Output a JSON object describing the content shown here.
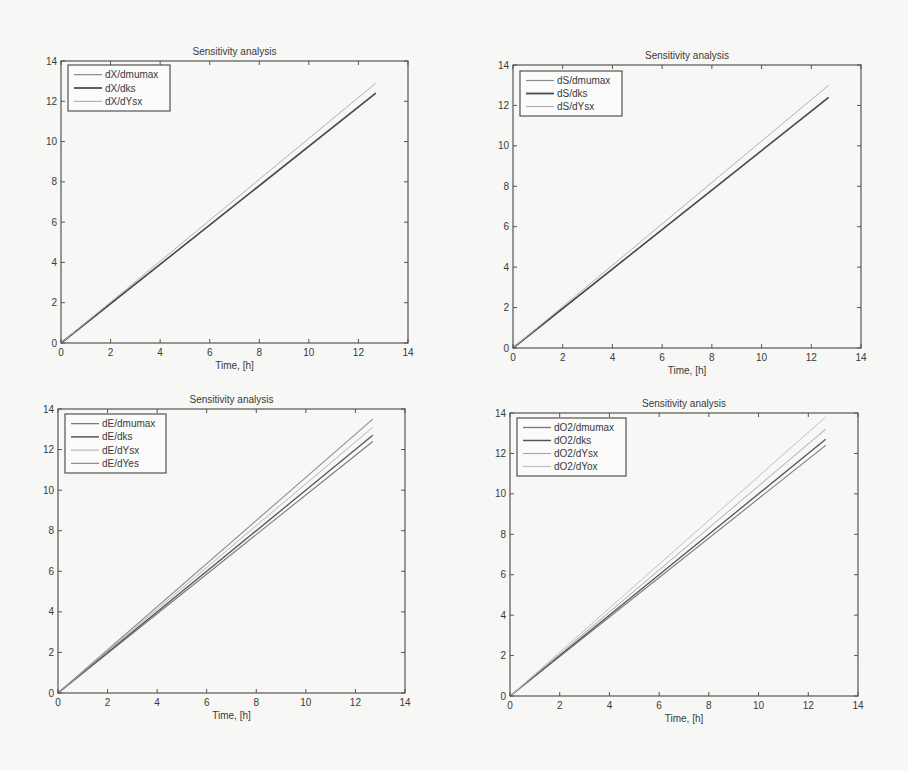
{
  "figure": {
    "width": 908,
    "height": 770,
    "background": "#f7f7f5"
  },
  "panels": [
    {
      "id": "dX",
      "title": "Sensitivity analysis",
      "xlabel": "Time, [h]",
      "box": {
        "left": 61,
        "top": 61,
        "right": 408,
        "bottom": 343
      },
      "legend": {
        "x": 68,
        "y": 65,
        "w": 102,
        "h": 46
      },
      "xticks": [
        "0",
        "2",
        "4",
        "6",
        "8",
        "10",
        "12",
        "14"
      ],
      "yticks": [
        "0",
        "2",
        "4",
        "6",
        "8",
        "10",
        "12",
        "14"
      ]
    },
    {
      "id": "dS",
      "title": "Sensitivity analysis",
      "xlabel": "Time, [h]",
      "box": {
        "left": 513,
        "top": 65,
        "right": 861,
        "bottom": 348
      },
      "legend": {
        "x": 520,
        "y": 71,
        "w": 102,
        "h": 45
      },
      "xticks": [
        "0",
        "2",
        "4",
        "6",
        "8",
        "10",
        "12",
        "14"
      ],
      "yticks": [
        "0",
        "2",
        "4",
        "6",
        "8",
        "10",
        "12",
        "14"
      ]
    },
    {
      "id": "dE",
      "title": "Sensitivity analysis",
      "xlabel": "Time, [h]",
      "box": {
        "left": 58,
        "top": 409,
        "right": 405,
        "bottom": 693
      },
      "legend": {
        "x": 65,
        "y": 414,
        "w": 101,
        "h": 59
      },
      "xticks": [
        "0",
        "2",
        "4",
        "6",
        "8",
        "10",
        "12",
        "14"
      ],
      "yticks": [
        "0",
        "2",
        "4",
        "6",
        "8",
        "10",
        "12",
        "14"
      ]
    },
    {
      "id": "dO2",
      "title": "Sensitivity analysis",
      "xlabel": "Time, [h]",
      "box": {
        "left": 510,
        "top": 413,
        "right": 858,
        "bottom": 696
      },
      "legend": {
        "x": 517,
        "y": 418,
        "w": 109,
        "h": 58
      },
      "xticks": [
        "0",
        "2",
        "4",
        "6",
        "8",
        "10",
        "12",
        "14"
      ],
      "yticks": [
        "0",
        "2",
        "4",
        "6",
        "8",
        "10",
        "12",
        "14"
      ]
    }
  ],
  "chart_data": [
    {
      "type": "line",
      "title": "Sensitivity analysis",
      "xlabel": "Time, [h]",
      "ylabel": "",
      "xlim": [
        0,
        14
      ],
      "ylim": [
        0,
        14
      ],
      "grid": false,
      "legend_position": "upper left",
      "series": [
        {
          "name": "dX/dmumax",
          "x": [
            0,
            12.7
          ],
          "y": [
            0,
            12.4
          ],
          "color": "#8a8a8a",
          "width": 1.0
        },
        {
          "name": "dX/dks",
          "x": [
            0,
            12.7
          ],
          "y": [
            0,
            12.4
          ],
          "color": "#4a4a4a",
          "width": 1.6
        },
        {
          "name": "dX/dYsx",
          "x": [
            0,
            12.7
          ],
          "y": [
            0,
            12.9
          ],
          "color": "#b0b0b0",
          "width": 1.0
        }
      ]
    },
    {
      "type": "line",
      "title": "Sensitivity analysis",
      "xlabel": "Time, [h]",
      "ylabel": "",
      "xlim": [
        0,
        14
      ],
      "ylim": [
        0,
        14
      ],
      "grid": false,
      "legend_position": "upper left",
      "series": [
        {
          "name": "dS/dmumax",
          "x": [
            0,
            12.7
          ],
          "y": [
            0,
            12.4
          ],
          "color": "#8a8a8a",
          "width": 1.0
        },
        {
          "name": "dS/dks",
          "x": [
            0,
            12.7
          ],
          "y": [
            0,
            12.4
          ],
          "color": "#4a4a4a",
          "width": 1.6
        },
        {
          "name": "dS/dYsx",
          "x": [
            0,
            12.7
          ],
          "y": [
            0,
            13.0
          ],
          "color": "#b0b0b0",
          "width": 1.0
        }
      ]
    },
    {
      "type": "line",
      "title": "Sensitivity analysis",
      "xlabel": "Time, [h]",
      "ylabel": "",
      "xlim": [
        0,
        14
      ],
      "ylim": [
        0,
        14
      ],
      "grid": false,
      "legend_position": "upper left",
      "series": [
        {
          "name": "dE/dmumax",
          "x": [
            0,
            12.7
          ],
          "y": [
            0,
            12.4
          ],
          "color": "#7a7a7a",
          "width": 1.1
        },
        {
          "name": "dE/dks",
          "x": [
            0,
            12.7
          ],
          "y": [
            0,
            12.7
          ],
          "color": "#555555",
          "width": 1.3
        },
        {
          "name": "dE/dYsx",
          "x": [
            0,
            12.7
          ],
          "y": [
            0,
            13.1
          ],
          "color": "#b5b5b5",
          "width": 1.0
        },
        {
          "name": "dE/dYes",
          "x": [
            0,
            12.7
          ],
          "y": [
            0,
            13.5
          ],
          "color": "#8f8f8f",
          "width": 1.1
        }
      ]
    },
    {
      "type": "line",
      "title": "Sensitivity analysis",
      "xlabel": "Time, [h]",
      "ylabel": "",
      "xlim": [
        0,
        14
      ],
      "ylim": [
        0,
        14
      ],
      "grid": false,
      "legend_position": "upper left",
      "series": [
        {
          "name": "dO2/dmumax",
          "x": [
            0,
            12.7
          ],
          "y": [
            0,
            12.4
          ],
          "color": "#7a7a7a",
          "width": 1.1
        },
        {
          "name": "dO2/dks",
          "x": [
            0,
            12.7
          ],
          "y": [
            0,
            12.7
          ],
          "color": "#555555",
          "width": 1.3
        },
        {
          "name": "dO2/dYsx",
          "x": [
            0,
            12.7
          ],
          "y": [
            0,
            13.2
          ],
          "color": "#a8a8a8",
          "width": 1.0
        },
        {
          "name": "dO2/dYox",
          "x": [
            0,
            12.7
          ],
          "y": [
            0,
            13.8
          ],
          "color": "#c2c2c2",
          "width": 1.0
        }
      ]
    }
  ]
}
